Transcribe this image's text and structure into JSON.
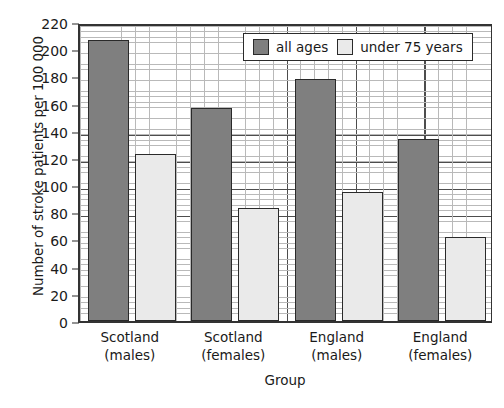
{
  "chart_data": {
    "type": "bar",
    "title": "",
    "xlabel": "Group",
    "ylabel": "Number of stroke patients per 100 000",
    "categories": [
      "Scotland (males)",
      "Scotland (females)",
      "England (males)",
      "England (females)"
    ],
    "category_lines": [
      [
        "Scotland",
        "(males)"
      ],
      [
        "Scotland",
        "(females)"
      ],
      [
        "England",
        "(males)"
      ],
      [
        "England",
        "(females)"
      ]
    ],
    "series": [
      {
        "name": "all ages",
        "color": "#7f7f7f",
        "values": [
          207,
          157,
          178,
          134
        ]
      },
      {
        "name": "under 75 years",
        "color": "#eaeaea",
        "values": [
          123,
          83,
          95,
          62
        ]
      }
    ],
    "ylim": [
      0,
      220
    ],
    "ytick_step": 20,
    "yticks": [
      0,
      20,
      40,
      60,
      80,
      100,
      120,
      140,
      160,
      180,
      200,
      220
    ],
    "ytick_labels": [
      "0",
      "20",
      "40",
      "60",
      "80",
      "100",
      "120",
      "140",
      "160",
      "180",
      "200",
      "220"
    ],
    "grid": true,
    "minor_grid": true,
    "legend_position": "top-right"
  },
  "legend": {
    "items": [
      {
        "label": "all ages",
        "swatch": "legend-swatch-all-ages"
      },
      {
        "label": "under 75 years",
        "swatch": "legend-swatch-under-75"
      }
    ]
  },
  "colors": {
    "series_all_ages": "#7f7f7f",
    "series_under_75": "#eaeaea",
    "axis": "#2b2b2b",
    "grid_major": "#4d4d4d",
    "grid_minor": "#b9b9b9",
    "background": "#ffffff",
    "text": "#1a1a1a"
  }
}
